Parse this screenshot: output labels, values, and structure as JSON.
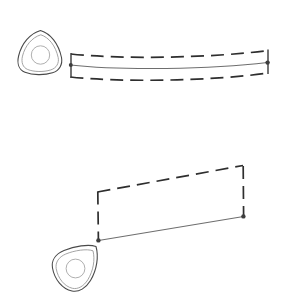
{
  "canvas": {
    "width": 283,
    "height": 301,
    "background": "#ffffff",
    "title": "Sweep envelope diagram"
  },
  "colors": {
    "body_outline": "#4a4a4a",
    "body_inner": "#9a9a9a",
    "bore": "#b0b0b0",
    "solid_path": "#6e6e6e",
    "dashed_path": "#2e2e2e",
    "bracket": "#3a3a3a",
    "node": "#3d3d3d",
    "fill": "#ffffff"
  },
  "figures": [
    {
      "id": "figure-top",
      "label": "Curved sweep with upper and lower envelope",
      "body": {
        "label": "Reuleaux triangle body, apex up",
        "outline_path": "M 40.5 30.5 C 50.5 33.5 58.5 43.5 61.5 57.5 C 62.8 64.5 59.5 70.5 52.5 72.8 C 44.0 75.5 32.5 75.2 25.0 72.2 C 19.0 69.8 16.8 63.5 18.6 56.0 C 21.6 43.5 30.0 33.5 40.5 30.5 Z",
        "inner_path": "M 40.8 34.8 C 49.0 37.4 55.6 45.8 58.2 57.6 C 59.2 63.2 56.6 68.0 50.8 69.9 C 43.6 72.2 34.0 72.0 27.7 69.5 C 22.8 67.5 21.0 62.3 22.5 56.1 C 25.0 45.8 32.1 37.4 40.8 34.8 Z",
        "bore": {
          "cx": 40.5,
          "cy": 55.0,
          "r": 9.2
        }
      },
      "solid_path": {
        "label": "centre sweep line",
        "d": "M 70.5 65.0 C 120.0 70.5 210.0 69.5 267.5 62.5"
      },
      "dashed_paths": [
        {
          "label": "upper envelope",
          "d": "M 71.0 54.0 C 120.0 59.5 212.0 58.0 268.0 50.5"
        },
        {
          "label": "lower envelope",
          "d": "M 70.5 77.0 C 120.0 82.5 212.0 81.0 268.5 73.0"
        }
      ],
      "brackets": [
        {
          "label": "left extent bracket",
          "d": "M 71.0 53.0 L 71.0 78.0"
        },
        {
          "label": "right extent bracket",
          "d": "M 268.0 49.5 L 268.0 74.0"
        }
      ],
      "nodes": [
        {
          "label": "left sweep node",
          "cx": 70.8,
          "cy": 65.0,
          "r": 2.0
        },
        {
          "label": "right sweep node",
          "cx": 267.6,
          "cy": 62.6,
          "r": 2.2
        }
      ]
    },
    {
      "id": "figure-bottom",
      "label": "Straight sweep with dashed return path",
      "body": {
        "label": "Reuleaux triangle body, apex up-right",
        "outline_path": "M 96.0 246.5 C 98.8 256.5 97.0 269.5 90.5 280.5 C 86.0 288.0 79.0 292.5 72.0 291.0 C 62.5 289.0 54.5 279.5 52.5 268.0 C 51.2 260.5 55.5 254.0 64.0 250.5 C 74.5 246.2 88.5 243.8 96.0 246.5 Z",
        "inner_path": "M 93.0 250.8 C 95.2 259.5 93.4 270.6 87.8 279.8 C 83.9 286.0 78.1 289.6 72.4 288.3 C 64.5 286.5 57.9 278.4 56.2 268.6 C 55.2 262.4 58.7 257.0 65.8 254.0 C 74.5 250.4 86.7 248.5 93.0 250.8 Z",
        "bore": {
          "cx": 75.5,
          "cy": 268.5,
          "r": 9.4
        }
      },
      "solid_path": {
        "label": "lower sweep line",
        "d": "M 98.5 240.5 L 243.5 216.5"
      },
      "dashed_paths": [
        {
          "label": "upper return path",
          "d": "M 97.5 192.0 L 243.0 165.5"
        },
        {
          "label": "left riser",
          "d": "M 97.8 191.5 L 98.4 240.0"
        },
        {
          "label": "right riser",
          "d": "M 243.2 166.0 L 243.6 216.0"
        }
      ],
      "brackets": [],
      "nodes": [
        {
          "label": "left sweep node",
          "cx": 98.4,
          "cy": 240.4,
          "r": 2.2
        },
        {
          "label": "right sweep node",
          "cx": 243.4,
          "cy": 216.4,
          "r": 2.2
        }
      ]
    }
  ]
}
